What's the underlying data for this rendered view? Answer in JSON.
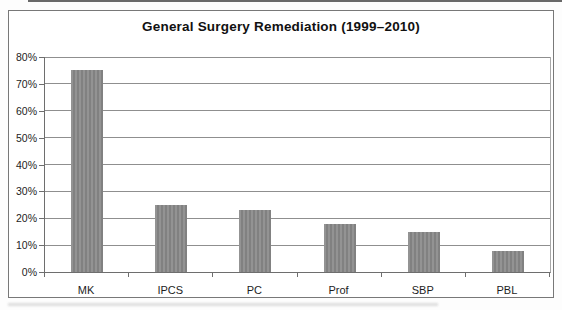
{
  "chart": {
    "title": "General Surgery Remediation (1999–2010)"
  },
  "chart_data": {
    "type": "bar",
    "title": "General Surgery Remediation (1999–2010)",
    "categories": [
      "MK",
      "IPCS",
      "PC",
      "Prof",
      "SBP",
      "PBL"
    ],
    "values": [
      75,
      25,
      23,
      18,
      15,
      8
    ],
    "xlabel": "",
    "ylabel": "",
    "ylim": [
      0,
      80
    ],
    "ytick_step": 10,
    "ytick_suffix": "%",
    "grid": true,
    "legend": false,
    "bar_color": "#8a8a8a"
  },
  "colors": {
    "bar_stripe_light": "#939393",
    "bar_stripe_dark": "#818181",
    "gridline": "#8f8f8f",
    "axis": "#6e6e6e",
    "frame_border": "#787878",
    "text": "#1d1d1d",
    "background": "#ffffff"
  }
}
